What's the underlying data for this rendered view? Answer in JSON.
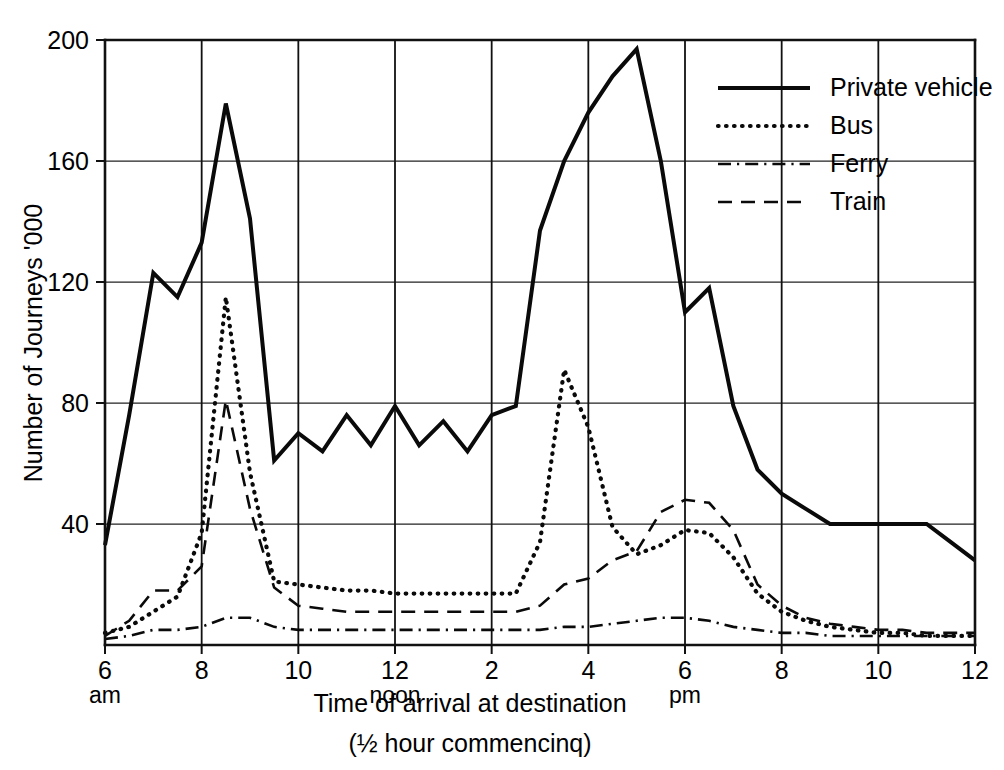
{
  "chart_data": {
    "type": "line",
    "title": "",
    "xlabel": "Time of arrival at destination",
    "xlabel_line2": "(½ hour commencinq)",
    "ylabel": "Number of Journeys '000",
    "ylim": [
      0,
      200
    ],
    "xlim": [
      6,
      24
    ],
    "grid": true,
    "legend_position": "top-right",
    "y_ticks": [
      40,
      80,
      120,
      160,
      200
    ],
    "y_tick_labels": [
      "40",
      "80",
      "120",
      "160",
      "200"
    ],
    "x_ticks": [
      6,
      8,
      10,
      12,
      14,
      16,
      18,
      20,
      22,
      24
    ],
    "x_tick_labels": [
      "6",
      "8",
      "10",
      "12",
      "2",
      "4",
      "6",
      "8",
      "10",
      "12"
    ],
    "x_tick_sublabels": [
      "am",
      "",
      "",
      "noon",
      "",
      "",
      "pm",
      "",
      "",
      ""
    ],
    "x": [
      6,
      6.5,
      7,
      7.5,
      8,
      8.5,
      9,
      9.5,
      10,
      10.5,
      11,
      11.5,
      12,
      12.5,
      13,
      13.5,
      14,
      14.5,
      15,
      15.5,
      16,
      16.5,
      17,
      17.5,
      18,
      18.5,
      19,
      19.5,
      20,
      20.5,
      21,
      21.5,
      22,
      22.5,
      23,
      23.5,
      24
    ],
    "series": [
      {
        "name": "Private vehicle",
        "style": "solid",
        "values": [
          33,
          76,
          123,
          115,
          133,
          179,
          141,
          61,
          70,
          64,
          76,
          66,
          79,
          66,
          74,
          64,
          76,
          79,
          137,
          160,
          176,
          188,
          197,
          160,
          110,
          118,
          79,
          58,
          50,
          45,
          40,
          40,
          40,
          40,
          40,
          34,
          28
        ]
      },
      {
        "name": "Bus",
        "style": "dotted",
        "values": [
          4,
          6,
          11,
          16,
          37,
          115,
          57,
          21,
          20,
          19,
          18,
          18,
          17,
          17,
          17,
          17,
          17,
          17,
          34,
          91,
          72,
          39,
          30,
          33,
          38,
          37,
          29,
          17,
          11,
          8,
          6,
          5,
          4,
          4,
          3,
          3,
          3
        ]
      },
      {
        "name": "Ferry",
        "style": "dash-dot",
        "values": [
          2,
          3,
          5,
          5,
          6,
          9,
          9,
          6,
          5,
          5,
          5,
          5,
          5,
          5,
          5,
          5,
          5,
          5,
          5,
          6,
          6,
          7,
          8,
          9,
          9,
          8,
          6,
          5,
          4,
          4,
          3,
          3,
          3,
          3,
          3,
          3,
          3
        ]
      },
      {
        "name": "Train",
        "style": "dashed",
        "values": [
          3,
          8,
          18,
          18,
          26,
          81,
          45,
          19,
          13,
          12,
          11,
          11,
          11,
          11,
          11,
          11,
          11,
          11,
          13,
          20,
          22,
          28,
          31,
          44,
          48,
          47,
          38,
          20,
          13,
          9,
          7,
          6,
          5,
          5,
          4,
          4,
          4
        ]
      }
    ]
  },
  "legend": {
    "items": [
      {
        "label": "Private vehicle",
        "style": "solid"
      },
      {
        "label": "Bus",
        "style": "dotted"
      },
      {
        "label": "Ferry",
        "style": "dash-dot"
      },
      {
        "label": "Train",
        "style": "dashed"
      }
    ]
  },
  "colors": {
    "ink": "#0a0a0a",
    "grid": "#222222",
    "background": "#ffffff"
  }
}
